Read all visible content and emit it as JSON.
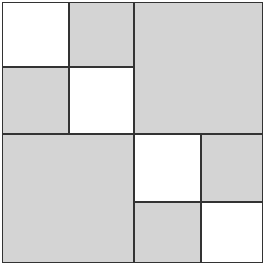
{
  "diagram": {
    "colors": {
      "shaded": "#d4d4d4",
      "unshaded": "#ffffff",
      "border": "#333333"
    },
    "cells": [
      {
        "id": "tl-tl",
        "x": 0,
        "y": 0,
        "w": 67,
        "h": 65,
        "fill": "white"
      },
      {
        "id": "tl-tr",
        "x": 67,
        "y": 0,
        "w": 65,
        "h": 65,
        "fill": "gray"
      },
      {
        "id": "tl-bl",
        "x": 0,
        "y": 65,
        "w": 67,
        "h": 67,
        "fill": "gray"
      },
      {
        "id": "tl-br",
        "x": 67,
        "y": 65,
        "w": 65,
        "h": 67,
        "fill": "white"
      },
      {
        "id": "tr",
        "x": 132,
        "y": 0,
        "w": 129,
        "h": 132,
        "fill": "gray"
      },
      {
        "id": "bl",
        "x": 0,
        "y": 132,
        "w": 132,
        "h": 129,
        "fill": "gray"
      },
      {
        "id": "br-tl",
        "x": 132,
        "y": 132,
        "w": 67,
        "h": 68,
        "fill": "white"
      },
      {
        "id": "br-tr",
        "x": 199,
        "y": 132,
        "w": 62,
        "h": 68,
        "fill": "gray"
      },
      {
        "id": "br-bl",
        "x": 132,
        "y": 200,
        "w": 67,
        "h": 61,
        "fill": "gray"
      },
      {
        "id": "br-br",
        "x": 199,
        "y": 200,
        "w": 62,
        "h": 61,
        "fill": "white"
      }
    ]
  }
}
